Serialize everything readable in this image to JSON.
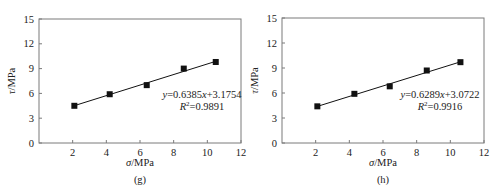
{
  "chart_data": [
    {
      "type": "scatter",
      "panel_label": "(g)",
      "xlabel_symbol": "σ",
      "xlabel_unit": "/MPa",
      "ylabel_symbol": "τ",
      "ylabel_unit": "/MPa",
      "xlim": [
        0,
        12
      ],
      "ylim": [
        0,
        15
      ],
      "xticks": [
        2,
        4,
        6,
        8,
        10,
        12
      ],
      "yticks": [
        0,
        3,
        6,
        9,
        12,
        15
      ],
      "grid": false,
      "series": [
        {
          "name": "data",
          "marker": "square",
          "x": [
            2.1,
            4.2,
            6.4,
            8.6,
            10.5
          ],
          "y": [
            4.5,
            5.9,
            7.0,
            9.0,
            9.8
          ]
        }
      ],
      "fit": {
        "slope": 0.6385,
        "intercept": 3.1754,
        "x_range": [
          2.1,
          10.5
        ]
      },
      "equation": {
        "y_var": "y",
        "eq_body": "=0.6385",
        "x_var": "x",
        "eq_tail": "+3.1754"
      },
      "r2": {
        "r_symbol": "R",
        "sup": "2",
        "value_text": "=0.9891"
      }
    },
    {
      "type": "scatter",
      "panel_label": "(h)",
      "xlabel_symbol": "σ",
      "xlabel_unit": "/MPa",
      "ylabel_symbol": "τ",
      "ylabel_unit": "/MPa",
      "xlim": [
        0,
        12
      ],
      "ylim": [
        0,
        15
      ],
      "xticks": [
        2,
        4,
        6,
        8,
        10,
        12
      ],
      "yticks": [
        0,
        3,
        6,
        9,
        12,
        15
      ],
      "grid": false,
      "series": [
        {
          "name": "data",
          "marker": "square",
          "x": [
            2.1,
            4.3,
            6.4,
            8.6,
            10.6
          ],
          "y": [
            4.4,
            5.9,
            6.8,
            8.7,
            9.7
          ]
        }
      ],
      "fit": {
        "slope": 0.6289,
        "intercept": 3.0722,
        "x_range": [
          2.1,
          10.6
        ]
      },
      "equation": {
        "y_var": "y",
        "eq_body": "=0.6289",
        "x_var": "x",
        "eq_tail": "+3.0722"
      },
      "r2": {
        "r_symbol": "R",
        "sup": "2",
        "value_text": "=0.9916"
      }
    }
  ]
}
